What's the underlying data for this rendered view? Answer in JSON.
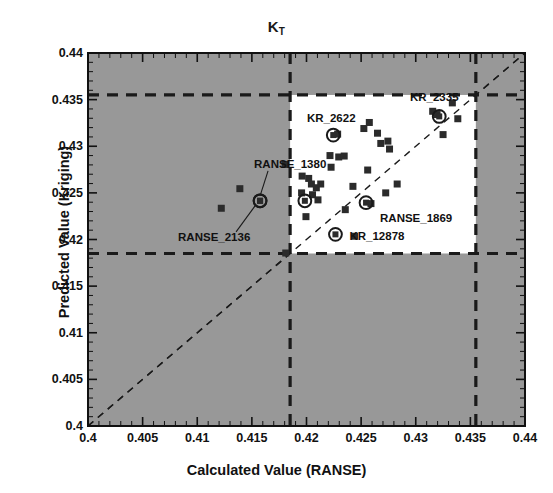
{
  "chart_data": {
    "type": "scatter",
    "title_base": "K",
    "title_sub": "T",
    "xlabel": "Calculated Value (RANSE)",
    "ylabel": "Predicted Value (Kriging)",
    "xlim": [
      0.4,
      0.44
    ],
    "ylim": [
      0.4,
      0.44
    ],
    "xticks": [
      "0.4",
      "0.405",
      "0.41",
      "0.415",
      "0.42",
      "0.425",
      "0.43",
      "0.435",
      "0.44"
    ],
    "xtick_values": [
      0.4,
      0.405,
      0.41,
      0.415,
      0.42,
      0.425,
      0.43,
      0.435,
      0.44
    ],
    "yticks": [
      "0.4",
      "0.405",
      "0.41",
      "0.415",
      "0.42",
      "0.425",
      "0.43",
      "0.435",
      "0.44"
    ],
    "ytick_values": [
      0.4,
      0.405,
      0.41,
      0.415,
      0.42,
      0.425,
      0.43,
      0.435,
      0.44
    ],
    "minor_tick_step": 0.001,
    "grid": false,
    "legend": "none",
    "plot_background": "#989898",
    "inset_background": "#ffffff",
    "marker_color": "#2b2b2b",
    "line_color": "#1a1a1a",
    "identity_line": {
      "from": [
        0.4,
        0.4
      ],
      "to": [
        0.44,
        0.44
      ],
      "style": "dashed",
      "label": "y = x"
    },
    "inset_region": {
      "xmin": 0.4185,
      "xmax": 0.4355,
      "ymin": 0.4185,
      "ymax": 0.4355,
      "style": "dashed"
    },
    "reference_lines": [
      {
        "orientation": "vertical",
        "value": 0.4185,
        "style": "dashed"
      },
      {
        "orientation": "vertical",
        "value": 0.4355,
        "style": "dashed"
      },
      {
        "orientation": "horizontal",
        "value": 0.4185,
        "style": "dashed"
      },
      {
        "orientation": "horizontal",
        "value": 0.4355,
        "style": "dashed"
      }
    ],
    "points": [
      {
        "x": 0.4122,
        "y": 0.42335
      },
      {
        "x": 0.4139,
        "y": 0.42545
      },
      {
        "x": 0.41805,
        "y": 0.42805
      },
      {
        "x": 0.4181,
        "y": 0.41855
      },
      {
        "x": 0.41955,
        "y": 0.425
      },
      {
        "x": 0.4196,
        "y": 0.4268
      },
      {
        "x": 0.4202,
        "y": 0.42655
      },
      {
        "x": 0.42045,
        "y": 0.42595
      },
      {
        "x": 0.42055,
        "y": 0.4248
      },
      {
        "x": 0.4209,
        "y": 0.42555
      },
      {
        "x": 0.42105,
        "y": 0.42425
      },
      {
        "x": 0.4213,
        "y": 0.42595
      },
      {
        "x": 0.41995,
        "y": 0.42245
      },
      {
        "x": 0.42215,
        "y": 0.429
      },
      {
        "x": 0.42225,
        "y": 0.42775
      },
      {
        "x": 0.42285,
        "y": 0.4313
      },
      {
        "x": 0.42295,
        "y": 0.42885
      },
      {
        "x": 0.42345,
        "y": 0.42895
      },
      {
        "x": 0.42355,
        "y": 0.4232
      },
      {
        "x": 0.42425,
        "y": 0.4257
      },
      {
        "x": 0.4244,
        "y": 0.42035
      },
      {
        "x": 0.42525,
        "y": 0.4319
      },
      {
        "x": 0.4256,
        "y": 0.42745
      },
      {
        "x": 0.42575,
        "y": 0.43255
      },
      {
        "x": 0.4259,
        "y": 0.42385
      },
      {
        "x": 0.4265,
        "y": 0.4314
      },
      {
        "x": 0.4268,
        "y": 0.4303
      },
      {
        "x": 0.42725,
        "y": 0.425
      },
      {
        "x": 0.42745,
        "y": 0.43055
      },
      {
        "x": 0.4276,
        "y": 0.4297
      },
      {
        "x": 0.4283,
        "y": 0.42595
      },
      {
        "x": 0.43155,
        "y": 0.43375
      },
      {
        "x": 0.43195,
        "y": 0.4334
      },
      {
        "x": 0.4325,
        "y": 0.43125
      },
      {
        "x": 0.43335,
        "y": 0.43465
      },
      {
        "x": 0.43385,
        "y": 0.43295
      }
    ],
    "highlighted_points": [
      {
        "label": "RANSE_1380",
        "x": 0.41575,
        "y": 0.42415,
        "label_dx": -6,
        "label_dy": -36,
        "leader": true
      },
      {
        "label": "RANSE_2136",
        "x": 0.41575,
        "y": 0.42415,
        "label_dx": -82,
        "label_dy": 37,
        "leader": true
      },
      {
        "label": "KR_2622",
        "x": 0.42245,
        "y": 0.4312,
        "label_dx": -2,
        "label_dy": -16,
        "leader": false
      },
      {
        "label": "KR_2335",
        "x": 0.43215,
        "y": 0.4332,
        "label_dx": -5,
        "label_dy": -18,
        "leader": false
      },
      {
        "label": "RANSE_1869",
        "x": 0.42545,
        "y": 0.42395,
        "label_dx": 14,
        "label_dy": 16,
        "leader": false
      },
      {
        "label": "KR_12878",
        "x": 0.42265,
        "y": 0.42055,
        "label_dx": 14,
        "label_dy": 3,
        "leader": false
      },
      {
        "label": "",
        "x": 0.41985,
        "y": 0.42415,
        "label_dx": 0,
        "label_dy": 0,
        "leader": false
      }
    ]
  }
}
